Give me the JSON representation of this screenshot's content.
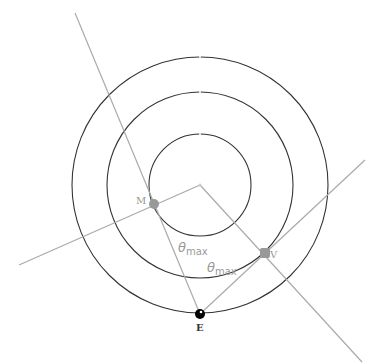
{
  "diagram": {
    "center": {
      "x": 200,
      "y": 185
    },
    "orbits": [
      {
        "name": "outer-orbit",
        "r": 128
      },
      {
        "name": "middle-orbit",
        "r": 93
      },
      {
        "name": "inner-orbit",
        "r": 51
      }
    ],
    "points": {
      "M": {
        "label": "M",
        "x": 154,
        "y": 204,
        "color": "#999999"
      },
      "V": {
        "label": "V",
        "x": 265,
        "y": 253,
        "color": "#999999"
      },
      "E": {
        "label": "E",
        "x": 200,
        "y": 314,
        "color": "#000000"
      }
    },
    "angle_labels": [
      {
        "text": "θ",
        "sub": "max",
        "x": 178,
        "y": 252
      },
      {
        "text": "θ",
        "sub": "max",
        "x": 207,
        "y": 272
      }
    ],
    "colors": {
      "orbit": "#333333",
      "line": "#aaaaaa",
      "label": "#999999",
      "earth": "#000000"
    }
  }
}
